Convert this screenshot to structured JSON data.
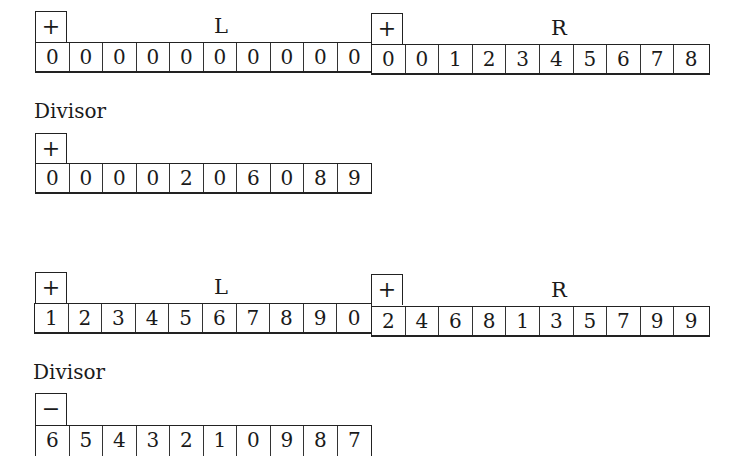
{
  "block1": {
    "L": {
      "sign": "+",
      "label": "L",
      "digits": [
        "0",
        "0",
        "0",
        "0",
        "0",
        "0",
        "0",
        "0",
        "0",
        "0"
      ]
    },
    "R": {
      "sign": "+",
      "label": "R",
      "digits": [
        "0",
        "0",
        "1",
        "2",
        "3",
        "4",
        "5",
        "6",
        "7",
        "8"
      ]
    },
    "divisor_caption": "Divisor",
    "divisor": {
      "sign": "+",
      "digits": [
        "0",
        "0",
        "0",
        "0",
        "2",
        "0",
        "6",
        "0",
        "8",
        "9"
      ]
    }
  },
  "block2": {
    "L": {
      "sign": "+",
      "label": "L",
      "digits": [
        "1",
        "2",
        "3",
        "4",
        "5",
        "6",
        "7",
        "8",
        "9",
        "0"
      ]
    },
    "R": {
      "sign": "+",
      "label": "R",
      "digits": [
        "2",
        "4",
        "6",
        "8",
        "1",
        "3",
        "5",
        "7",
        "9",
        "9"
      ]
    },
    "divisor_caption": "Divisor",
    "divisor": {
      "sign": "−",
      "digits": [
        "6",
        "5",
        "4",
        "3",
        "2",
        "1",
        "0",
        "9",
        "8",
        "7"
      ]
    }
  }
}
